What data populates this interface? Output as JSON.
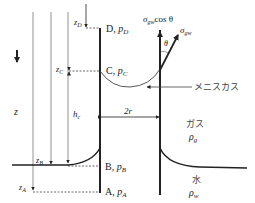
{
  "diagram": {
    "type": "capillary-rise",
    "labels": {
      "z_axis": "z",
      "zD": "z",
      "zD_sub": "D",
      "zC": "z",
      "zC_sub": "C",
      "zB": "z",
      "zB_sub": "B",
      "zA": "z",
      "zA_sub": "A",
      "hc": "h",
      "hc_sub": "c",
      "point_D": "D, ",
      "pD": "p",
      "pD_sub": "D",
      "point_C": "C, ",
      "pC": "p",
      "pC_sub": "C",
      "point_B": "B, ",
      "pB": "p",
      "pB_sub": "B",
      "point_A": "A, ",
      "pA": "p",
      "pA_sub": "A",
      "two_r": "2r",
      "sigma_cos": "σ",
      "sigma_cos_sub": "gw",
      "sigma_cos_tail": "cos θ",
      "sigma": "σ",
      "sigma_sub": "gw",
      "theta": "θ",
      "meniscus": "メニスカス",
      "gas": "ガス",
      "rho_g": "ρ",
      "rho_g_sub": "g",
      "water": "水",
      "rho_w": "ρ",
      "rho_w_sub": "w"
    },
    "colors": {
      "line": "#222222",
      "thin_line": "#777777"
    }
  }
}
